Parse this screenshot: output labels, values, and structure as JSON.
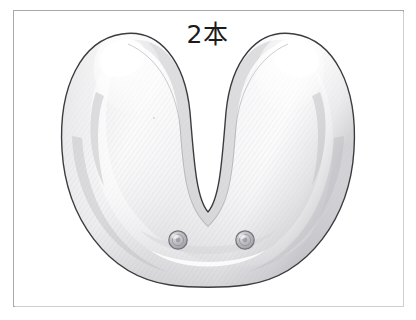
{
  "figure": {
    "kind": "dental-illustration",
    "caption": "2本",
    "frame": {
      "visible": true,
      "border_color": "#a8a8ac",
      "x": 13,
      "y": 10,
      "width": 391,
      "height": 297
    },
    "background_color": "#ffffff"
  },
  "arch": {
    "label": "mandibular arch",
    "outline_color": "#3c3c40",
    "fill_light": "#ffffff",
    "fill_mid": "#ededef",
    "fill_shadow": "#c9c9cd",
    "hatch_color": "#d6d6da",
    "ridge_highlight_color": "#fbfbfc"
  },
  "implants": {
    "count": 2,
    "count_label": "2本",
    "body_color": "#b6b6ba",
    "rim_color": "#7e7e84",
    "highlight_color": "#dedee1",
    "markers": [
      {
        "name": "implant-left",
        "cx": 178,
        "cy": 240,
        "r": 9
      },
      {
        "name": "implant-right",
        "cx": 245,
        "cy": 240,
        "r": 9
      }
    ]
  }
}
